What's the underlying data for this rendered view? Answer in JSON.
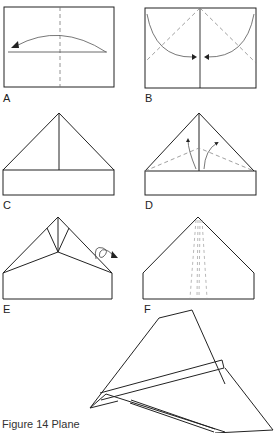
{
  "figure": {
    "caption": "Figure 14  Plane",
    "steps": [
      {
        "id": "A",
        "label": "A",
        "description": "Fold sheet in half lengthwise and unfold (vertical dashed center crease, arrow folding right edge to left)"
      },
      {
        "id": "B",
        "label": "B",
        "description": "Fold top corners down to center line (dashed diagonal fold lines, curved arrows toward center)"
      },
      {
        "id": "C",
        "label": "C",
        "description": "Result: triangular top with rectangular base"
      },
      {
        "id": "D",
        "label": "D",
        "description": "Fold angled edges to center (dashed fold lines, arrows up)"
      },
      {
        "id": "E",
        "label": "E",
        "description": "Turn over (looped arrow symbol)"
      },
      {
        "id": "F",
        "label": "F",
        "description": "Fold in half along center and fold wings down (dashed vertical lines)"
      },
      {
        "id": "G",
        "label": "",
        "description": "Finished paper plane in perspective"
      }
    ]
  },
  "colors": {
    "line": "#222222",
    "dashed": "#888888",
    "background": "#ffffff"
  }
}
